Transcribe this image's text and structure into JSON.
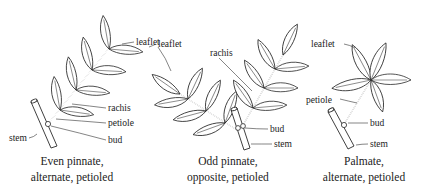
{
  "figure": {
    "colors": {
      "line": "#2a2a2a",
      "background": "#ffffff",
      "text": "#222222"
    }
  },
  "diagrams": [
    {
      "id": "even-pinnate",
      "caption_line1": "Even pinnate,",
      "caption_line2": "alternate, petioled",
      "labels": {
        "leaflet": "leaflet",
        "rachis": "rachis",
        "petiole": "petiole",
        "bud": "bud",
        "stem": "stem"
      }
    },
    {
      "id": "odd-pinnate",
      "caption_line1": "Odd pinnate,",
      "caption_line2": "opposite, petioled",
      "labels": {
        "leaflet": "leaflet",
        "rachis": "rachis",
        "bud": "bud",
        "stem": "stem"
      }
    },
    {
      "id": "palmate",
      "caption_line1": "Palmate,",
      "caption_line2": "alternate, petioled",
      "labels": {
        "leaflet": "leaflet",
        "petiole": "petiole",
        "bud": "bud",
        "stem": "stem"
      }
    }
  ]
}
